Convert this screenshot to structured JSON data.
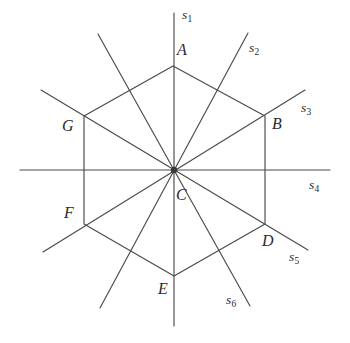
{
  "figure": {
    "type": "geometry-diagram",
    "stroke_color": "#4a4a4a",
    "text_color": "#2b2b2b",
    "background_color": "#ffffff"
  },
  "vertex_labels": [
    {
      "id": "A",
      "text": "A",
      "x": 177,
      "y": 42,
      "point_x": 173,
      "point_y": 66
    },
    {
      "id": "B",
      "text": "B",
      "x": 272,
      "y": 116,
      "point_x": 265,
      "point_y": 116
    },
    {
      "id": "C",
      "text": "C",
      "x": 176,
      "y": 187,
      "point_x": 174,
      "point_y": 170
    },
    {
      "id": "D",
      "text": "D",
      "x": 262,
      "y": 233,
      "point_x": 265,
      "point_y": 224
    },
    {
      "id": "E",
      "text": "E",
      "x": 158,
      "y": 281,
      "point_x": 174,
      "point_y": 276
    },
    {
      "id": "F",
      "text": "F",
      "x": 64,
      "y": 205,
      "point_x": 84,
      "point_y": 224
    },
    {
      "id": "G",
      "text": "G",
      "x": 62,
      "y": 118,
      "point_x": 84,
      "point_y": 116
    }
  ],
  "line_labels": [
    {
      "id": "s1",
      "base": "s",
      "sub": "1",
      "x": 182,
      "y": 8
    },
    {
      "id": "s2",
      "base": "s",
      "sub": "2",
      "x": 249,
      "y": 41
    },
    {
      "id": "s3",
      "base": "s",
      "sub": "3",
      "x": 301,
      "y": 101
    },
    {
      "id": "s4",
      "base": "s",
      "sub": "4",
      "x": 309,
      "y": 178
    },
    {
      "id": "s5",
      "base": "s",
      "sub": "5",
      "x": 289,
      "y": 250
    },
    {
      "id": "s6",
      "base": "s",
      "sub": "6",
      "x": 226,
      "y": 293
    }
  ],
  "hexagon": {
    "center": {
      "x": 174,
      "y": 170
    },
    "points": "173,66 265,116 265,224 174,276 84,224 84,116"
  },
  "lines": [
    {
      "id": "s1",
      "x1": 174,
      "y1": 13,
      "x2": 174,
      "y2": 326
    },
    {
      "id": "s2",
      "x1": 248,
      "y1": 33,
      "x2": 100,
      "y2": 308
    },
    {
      "id": "s3",
      "x1": 305,
      "y1": 90,
      "x2": 43,
      "y2": 252
    },
    {
      "id": "s4",
      "x1": 20,
      "y1": 170,
      "x2": 330,
      "y2": 170
    },
    {
      "id": "s5",
      "x1": 308,
      "y1": 250,
      "x2": 41,
      "y2": 90
    },
    {
      "id": "s6",
      "x1": 250,
      "y1": 306,
      "x2": 98,
      "y2": 34
    }
  ]
}
